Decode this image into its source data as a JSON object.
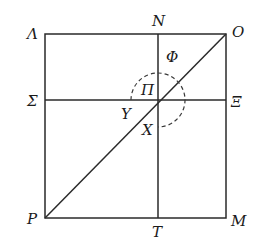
{
  "diagram": {
    "type": "geometric-figure",
    "colors": {
      "ink": "#2a2a2a",
      "background": "#ffffff"
    },
    "square": {
      "left": 45,
      "top": 34,
      "right": 226,
      "bottom": 218
    },
    "center": {
      "x": 158,
      "y": 100
    },
    "arc_radius": 27,
    "labels": {
      "top_left": "Λ",
      "top_mid": "N",
      "top_right": "O",
      "upper_inner": "Φ",
      "center": "Π",
      "mid_left": "Σ",
      "mid_right": "Ξ",
      "left_of_center": "Υ",
      "below_center": "X",
      "bottom_left": "P",
      "bottom_mid": "T",
      "bottom_right": "M"
    },
    "segments": [
      {
        "from": "Λ",
        "to": "O",
        "kind": "top-edge"
      },
      {
        "from": "O",
        "to": "M",
        "kind": "right-edge"
      },
      {
        "from": "M",
        "to": "P",
        "kind": "bottom-edge"
      },
      {
        "from": "P",
        "to": "Λ",
        "kind": "left-edge"
      },
      {
        "from": "N",
        "to": "T",
        "kind": "vertical-center-line"
      },
      {
        "from": "Σ",
        "to": "Ξ",
        "kind": "horizontal-center-line"
      },
      {
        "from": "P",
        "to": "O",
        "kind": "diagonal"
      }
    ]
  }
}
